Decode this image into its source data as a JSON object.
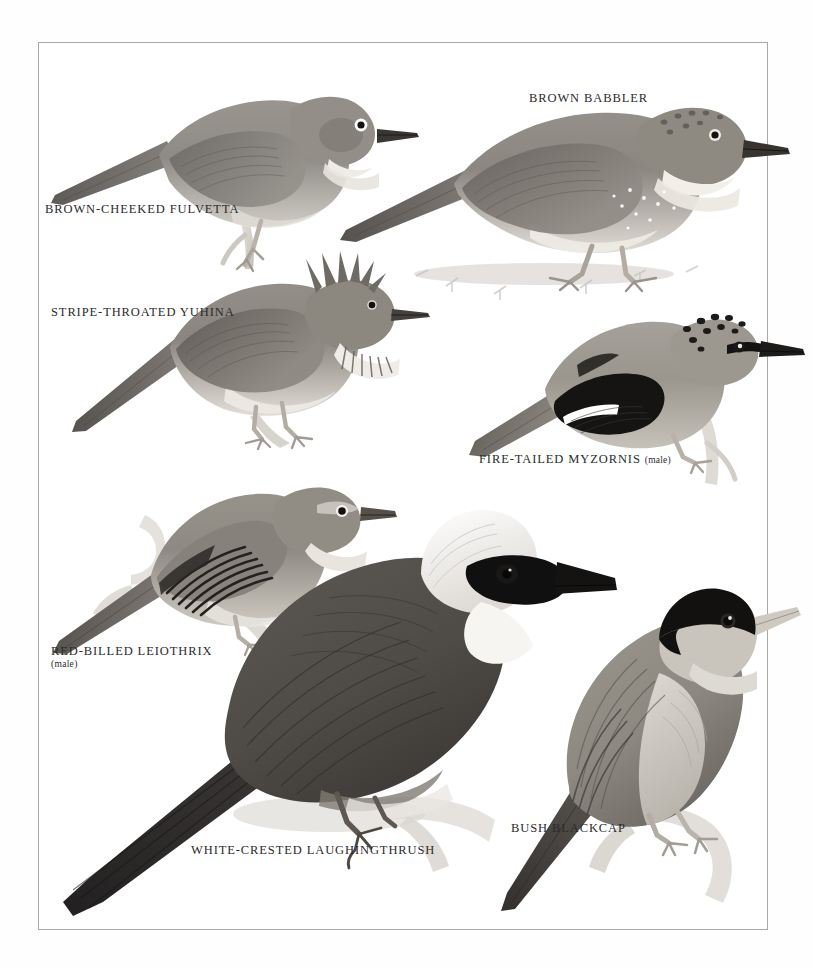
{
  "plate": {
    "title": "Babblers, laughingthrushes and allies",
    "background_color": "#ffffff",
    "frame_color": "#a8a8a8",
    "label_color": "#2b2b2b"
  },
  "species": [
    {
      "id": "brown-cheeked-fulvetta",
      "label": "BROWN-CHEEKED FULVETTA",
      "sub": "",
      "plumage": {
        "upper": "#8e8b86",
        "upper_dark": "#6d6a65",
        "under": "#cfcbc4",
        "throat": "#efece7",
        "bill": "#3a3733",
        "leg": "#b8b2a8",
        "eye_ring": "#ffffff"
      }
    },
    {
      "id": "brown-babbler",
      "label": "BROWN BABBLER",
      "sub": "",
      "plumage": {
        "upper": "#8b867f",
        "upper_dark": "#6a6560",
        "under": "#d8d4cc",
        "throat": "#f2efe9",
        "bill": "#37342f",
        "leg": "#a9a299",
        "spots": "#ffffff"
      }
    },
    {
      "id": "stripe-throated-yuhina",
      "label": "STRIPE-THROATED YUHINA",
      "sub": "",
      "plumage": {
        "upper": "#8a857e",
        "upper_dark": "#615d58",
        "under": "#ddd9d1",
        "throat": "#f0ede7",
        "bill": "#44403b",
        "leg": "#b4ada3",
        "streak": "#5d5954"
      }
    },
    {
      "id": "fire-tailed-myzornis",
      "label": "FIRE-TAILED MYZORNIS",
      "sub": "(male)",
      "sub_inline": true,
      "plumage": {
        "upper": "#9a958d",
        "upper_dark": "#6f6a64",
        "under": "#c6c1b9",
        "crown_spots": "#1d1b19",
        "wing_patch": "#151413",
        "wing_bar": "#ffffff",
        "bill": "#1e1c1a",
        "leg": "#b9b2a8"
      }
    },
    {
      "id": "red-billed-leiothrix",
      "label": "RED-BILLED LEIOTHRIX",
      "sub": "(male)",
      "sub_inline": false,
      "plumage": {
        "upper": "#8e8982",
        "upper_dark": "#625e59",
        "under": "#c8c3bb",
        "throat": "#e8e5df",
        "wing_dark": "#232120",
        "bill": "#55504a",
        "leg": "#b6afa5",
        "eye_ring": "#f4f2ee"
      }
    },
    {
      "id": "white-crested-laughingthrush",
      "label": "WHITE-CRESTED LAUGHINGTHRUSH",
      "sub": "",
      "plumage": {
        "upper": "#4f4b47",
        "upper_dark": "#332f2d",
        "tail": "#2a2725",
        "crest": "#fbfaf8",
        "mask": "#111010",
        "bill": "#141312",
        "under": "#6a645e",
        "leg": "#5e5850"
      }
    },
    {
      "id": "bush-blackcap",
      "label": "BUSH BLACKCAP",
      "sub": "",
      "plumage": {
        "cap": "#121110",
        "upper": "#8d8880",
        "upper_dark": "#66625d",
        "under": "#c9c5bd",
        "throat": "#ddd9d3",
        "bill": "#cfcabf",
        "leg": "#b3ada3"
      }
    }
  ],
  "perches": {
    "branch_color": "#d7d4ce",
    "branch_shadow": "#bdb9b2",
    "ground_color": "#cfcbc5"
  }
}
